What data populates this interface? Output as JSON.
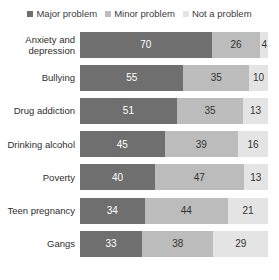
{
  "legend": {
    "position": "top-center",
    "items": [
      {
        "label": "Major problem",
        "color": "#6f6f6f"
      },
      {
        "label": "Minor problem",
        "color": "#bcbcbc"
      },
      {
        "label": "Not a problem",
        "color": "#e4e4e4"
      }
    ]
  },
  "chart_data": {
    "type": "bar",
    "orientation": "horizontal",
    "stacked": true,
    "stacked_percent": true,
    "title": "",
    "subtitle": "",
    "xlabel": "",
    "ylabel": "",
    "xlim": [
      0,
      100
    ],
    "grid": false,
    "legend_position": "top-center",
    "categories": [
      "Anxiety and depression",
      "Bullying",
      "Drug addiction",
      "Drinking alcohol",
      "Poverty",
      "Teen pregnancy",
      "Gangs"
    ],
    "series": [
      {
        "name": "Major problem",
        "color": "#6f6f6f",
        "values": [
          70,
          55,
          51,
          45,
          40,
          34,
          33
        ]
      },
      {
        "name": "Minor problem",
        "color": "#bcbcbc",
        "values": [
          26,
          35,
          35,
          39,
          47,
          44,
          38
        ]
      },
      {
        "name": "Not a problem",
        "color": "#e4e4e4",
        "values": [
          4,
          10,
          13,
          16,
          13,
          21,
          29
        ]
      }
    ]
  },
  "rows": [
    {
      "label": "Anxiety and depression",
      "label_lines": [
        "Anxiety and",
        "depression"
      ],
      "major": 70,
      "minor": 26,
      "none": 4
    },
    {
      "label": "Bullying",
      "label_lines": [
        "Bullying"
      ],
      "major": 55,
      "minor": 35,
      "none": 10
    },
    {
      "label": "Drug addiction",
      "label_lines": [
        "Drug addiction"
      ],
      "major": 51,
      "minor": 35,
      "none": 13
    },
    {
      "label": "Drinking alcohol",
      "label_lines": [
        "Drinking alcohol"
      ],
      "major": 45,
      "minor": 39,
      "none": 16
    },
    {
      "label": "Poverty",
      "label_lines": [
        "Poverty"
      ],
      "major": 40,
      "minor": 47,
      "none": 13
    },
    {
      "label": "Teen pregnancy",
      "label_lines": [
        "Teen pregnancy"
      ],
      "major": 34,
      "minor": 44,
      "none": 21
    },
    {
      "label": "Gangs",
      "label_lines": [
        "Gangs"
      ],
      "major": 33,
      "minor": 38,
      "none": 29
    }
  ]
}
